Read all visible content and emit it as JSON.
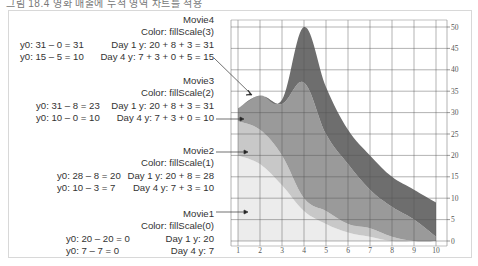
{
  "caption": "그림 18.4 영화 매출에 누적 영역 차트를 적용",
  "chart_data": {
    "type": "area",
    "stacked": true,
    "title": "",
    "xlabel": "",
    "ylabel": "",
    "x": [
      1,
      2,
      3,
      4,
      5,
      6,
      7,
      8,
      9,
      10
    ],
    "xticks": [
      "1",
      "2",
      "3",
      "4",
      "5",
      "6",
      "7",
      "8",
      "9",
      "10"
    ],
    "yticks": [
      "0",
      "5",
      "10",
      "15",
      "20",
      "25",
      "30",
      "35",
      "40",
      "45",
      "50"
    ],
    "ylim": [
      0,
      50
    ],
    "xlim": [
      1,
      10
    ],
    "grid": true,
    "y_axis_position": "right",
    "series": [
      {
        "name": "Movie1",
        "color": "#ececec",
        "values": [
          20,
          18,
          13,
          7,
          4,
          2,
          1,
          0,
          0,
          0
        ]
      },
      {
        "name": "Movie2",
        "color": "#c8c8c8",
        "values": [
          8,
          8,
          7,
          3,
          3,
          2,
          2,
          1,
          0,
          0
        ]
      },
      {
        "name": "Movie3",
        "color": "#9a9a9a",
        "values": [
          3,
          8,
          12,
          27,
          18,
          14,
          9,
          7,
          5,
          1
        ]
      },
      {
        "name": "Movie4",
        "color": "#6e6e6e",
        "values": [
          0,
          0,
          1,
          13,
          11,
          8,
          8,
          7,
          7,
          8
        ]
      }
    ]
  },
  "annotations": [
    {
      "name": "Movie4",
      "color_line": "Color: fillScale(3)",
      "left": [
        "y0: 31 – 0 = 31",
        "y0: 15 – 5 = 10"
      ],
      "right": [
        "Day 1 y: 20 + 8 + 3 = 31",
        "Day 4 y: 7 + 3  + 0 + 5 = 15"
      ]
    },
    {
      "name": "Movie3",
      "color_line": "Color: fillScale(2)",
      "left": [
        "y0: 31 – 8 = 23",
        "y0: 10 – 0 = 10"
      ],
      "right": [
        "Day 1 y: 20 + 8 + 3 = 31",
        "Day 4 y: 7 + 3  + 0 = 10"
      ]
    },
    {
      "name": "Movie2",
      "color_line": "Color: fillScale(1)",
      "left": [
        "y0: 28 – 8 = 20",
        "y0: 10 – 3 = 7"
      ],
      "right": [
        "Day 1 y: 20 + 8 = 28",
        "Day 4 y: 7 + 3 = 10"
      ]
    },
    {
      "name": "Movie1",
      "color_line": "Color: fillScale(0)",
      "left": [
        "y0: 20 – 20 = 0",
        "y0: 7 – 7 = 0"
      ],
      "right": [
        "Day 1 y: 20",
        "Day 4 y: 7"
      ]
    }
  ]
}
